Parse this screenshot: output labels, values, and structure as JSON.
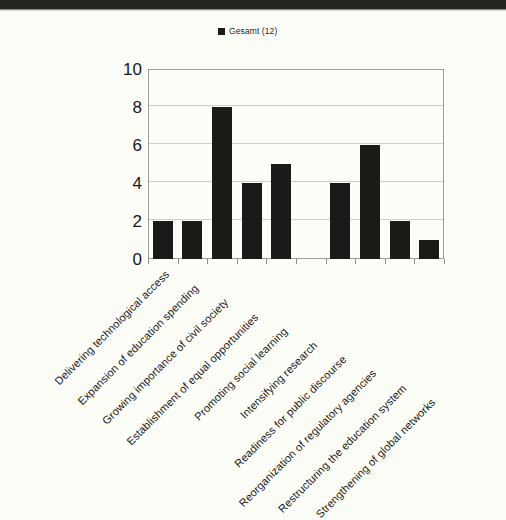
{
  "legend": {
    "entries": [
      {
        "label": "Gesamt (12)",
        "color": "#1b1b1b",
        "marker": "square-marker"
      }
    ]
  },
  "chart_data": {
    "type": "bar",
    "title": "",
    "subtitle": "",
    "xlabel": "",
    "ylabel": "",
    "ylim": [
      0,
      10
    ],
    "yticks": [
      0,
      2,
      4,
      6,
      8,
      10
    ],
    "grid": true,
    "legend_position": "top-center",
    "bar_color": "#1c1a18",
    "categories": [
      "Delivering technological access",
      "Expansion of education spending",
      "Growing importance of civil society",
      "Establishment of equal opportunities",
      "Promoting social learning",
      "Intensifying research",
      "Readiness for public discourse",
      "Reorganization of regulatory agencies",
      "Restructuring the education system",
      "Strengthening of global networks"
    ],
    "series": [
      {
        "name": "Gesamt (12)",
        "values": [
          2,
          2,
          8,
          4,
          5,
          0,
          4,
          6,
          2,
          1
        ]
      }
    ]
  }
}
